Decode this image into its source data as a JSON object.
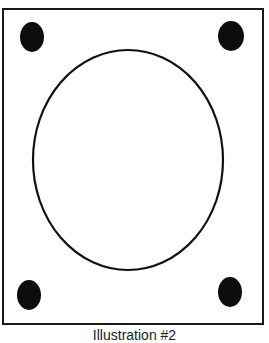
{
  "figure": {
    "caption": "Illustration #2",
    "frame": {
      "x": 2,
      "y": 8,
      "width": 262,
      "height": 317,
      "stroke": "#1a1a1a"
    },
    "ellipse": {
      "cx": 128,
      "cy": 160,
      "rx": 95,
      "ry": 110,
      "stroke": "#111111",
      "fill": "none"
    },
    "dots": [
      {
        "name": "top-left",
        "cx": 32,
        "cy": 37,
        "rx": 12,
        "ry": 15
      },
      {
        "name": "top-right",
        "cx": 231,
        "cy": 36,
        "rx": 13,
        "ry": 15
      },
      {
        "name": "bottom-left",
        "cx": 29,
        "cy": 295,
        "rx": 12,
        "ry": 15
      },
      {
        "name": "bottom-right",
        "cx": 230,
        "cy": 292,
        "rx": 12,
        "ry": 15
      }
    ],
    "dot_color": "#0d0d0d"
  }
}
